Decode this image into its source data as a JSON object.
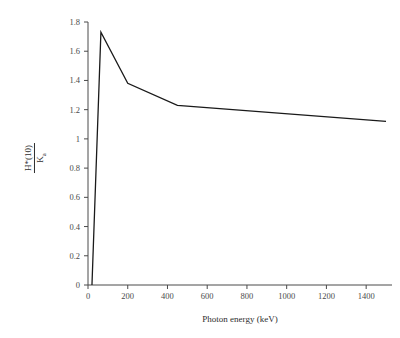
{
  "chart_data": {
    "type": "line",
    "title": "",
    "subtitle": "",
    "xlabel": "Photon energy (keV)",
    "ylabel": "H*(10) / Ka",
    "ylabel_numerator": "H*(10)",
    "ylabel_denominator": "Ka",
    "ylabel_denominator_base": "K",
    "ylabel_denominator_sub": "a",
    "xlim": [
      0,
      1520
    ],
    "ylim": [
      0,
      1.8
    ],
    "grid": false,
    "legend": null,
    "legend_position": "none",
    "line_color": "#1a1a1a",
    "axis_color": "#4a4a4a",
    "background_color": "#ffffff",
    "xticks": [
      0,
      200,
      400,
      600,
      800,
      1000,
      1200,
      1400
    ],
    "xtick_labels": [
      "0",
      "200",
      "400",
      "600",
      "800",
      "1000",
      "1200",
      "1400"
    ],
    "yticks": [
      0,
      0.2,
      0.4,
      0.6,
      0.8,
      1.0,
      1.2,
      1.4,
      1.6,
      1.8
    ],
    "ytick_labels": [
      "0",
      "0.2",
      "0.4",
      "0.6",
      "0.8",
      "1",
      "1.2",
      "1.4",
      "1.6",
      "1.8"
    ],
    "x": [
      20,
      65,
      200,
      450,
      1500
    ],
    "values": [
      0.0,
      1.73,
      1.38,
      1.23,
      1.12
    ],
    "series": [
      {
        "name": "H*(10)/Ka",
        "x": [
          20,
          65,
          200,
          450,
          1500
        ],
        "values": [
          0.0,
          1.73,
          1.38,
          1.23,
          1.12
        ]
      }
    ],
    "annotations": []
  },
  "axes": {
    "x_axis_title": "Photon energy (keV)",
    "y_axis_numerator": "H*(10)",
    "y_axis_denominator_base": "K",
    "y_axis_denominator_sub": "a"
  }
}
